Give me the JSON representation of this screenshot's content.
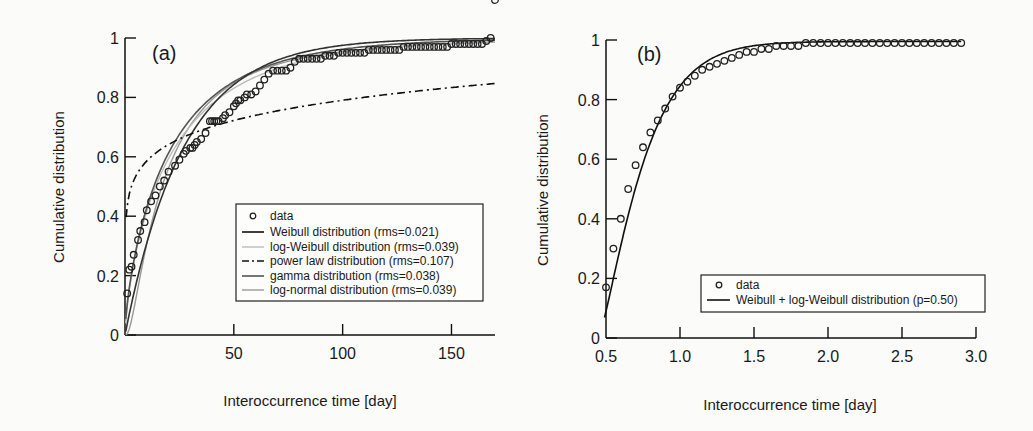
{
  "chart_data": [
    {
      "type": "line",
      "panel_label": "(a)",
      "title": "",
      "xlabel": "Interoccurrence time [day]",
      "ylabel": "Cumulative distribution",
      "xlim": [
        0,
        170
      ],
      "ylim": [
        0,
        1
      ],
      "xticks": [
        "50",
        "100",
        "150"
      ],
      "yticks": [
        "0",
        "0.2",
        "0.4",
        "0.6",
        "0.8",
        "1"
      ],
      "grid": false,
      "legend_position": "lower right",
      "series": [
        {
          "name": "data",
          "style": "open-circle",
          "x": [
            1,
            2,
            3,
            4,
            6,
            7,
            9,
            10,
            12,
            14,
            16,
            18,
            20,
            23,
            25,
            27,
            28,
            30,
            31,
            32,
            33,
            35,
            37,
            39,
            40,
            41,
            42,
            43,
            45,
            46,
            48,
            50,
            51,
            52,
            53,
            55,
            56,
            58,
            60,
            62,
            64,
            66,
            68,
            70,
            72,
            74,
            76,
            78,
            80,
            82,
            84,
            86,
            88,
            90,
            92,
            94,
            96,
            98,
            100,
            102,
            104,
            106,
            108,
            110,
            112,
            114,
            116,
            118,
            120,
            122,
            124,
            126,
            128,
            130,
            132,
            134,
            136,
            138,
            140,
            142,
            144,
            146,
            148,
            150,
            152,
            154,
            156,
            158,
            160,
            162,
            164,
            166,
            168,
            170
          ],
          "y": [
            0.14,
            0.22,
            0.23,
            0.27,
            0.32,
            0.35,
            0.38,
            0.42,
            0.45,
            0.47,
            0.5,
            0.52,
            0.55,
            0.57,
            0.59,
            0.61,
            0.62,
            0.63,
            0.63,
            0.64,
            0.65,
            0.66,
            0.68,
            0.72,
            0.72,
            0.72,
            0.72,
            0.72,
            0.73,
            0.74,
            0.75,
            0.77,
            0.78,
            0.79,
            0.79,
            0.8,
            0.81,
            0.81,
            0.82,
            0.84,
            0.86,
            0.88,
            0.89,
            0.89,
            0.89,
            0.89,
            0.9,
            0.92,
            0.93,
            0.93,
            0.93,
            0.93,
            0.93,
            0.93,
            0.94,
            0.94,
            0.94,
            0.95,
            0.95,
            0.95,
            0.95,
            0.95,
            0.95,
            0.95,
            0.96,
            0.96,
            0.96,
            0.96,
            0.96,
            0.96,
            0.96,
            0.96,
            0.97,
            0.97,
            0.97,
            0.97,
            0.97,
            0.97,
            0.97,
            0.97,
            0.97,
            0.97,
            0.97,
            0.98,
            0.98,
            0.98,
            0.98,
            0.98,
            0.98,
            0.98,
            0.98,
            0.99,
            1.0
          ]
        },
        {
          "name": "Weibull distribution (rms=0.021)",
          "style": "solid-black",
          "rms": 0.021
        },
        {
          "name": "log-Weibull distribution (rms=0.039)",
          "style": "solid-lightgray",
          "rms": 0.039
        },
        {
          "name": "power law distribution (rms=0.107)",
          "style": "dash-dot-black",
          "rms": 0.107
        },
        {
          "name": "gamma distribution (rms=0.038)",
          "style": "solid-darkgray",
          "rms": 0.038
        },
        {
          "name": "log-normal distribution (rms=0.039)",
          "style": "solid-gray",
          "rms": 0.039
        }
      ],
      "legend": [
        "data",
        "Weibull distribution (rms=0.021)",
        "log-Weibull distribution (rms=0.039)",
        "power law distribution (rms=0.107)",
        "gamma distribution (rms=0.038)",
        "log-normal distribution (rms=0.039)"
      ]
    },
    {
      "type": "line",
      "panel_label": "(b)",
      "title": "",
      "xlabel": "Interoccurrence time [day]",
      "ylabel": "Cumulative distribution",
      "xlim": [
        0.5,
        3.0
      ],
      "ylim": [
        0,
        1
      ],
      "xticks": [
        "0.5",
        "1.0",
        "1.5",
        "2.0",
        "2.5",
        "3.0"
      ],
      "yticks": [
        "0",
        "0.2",
        "0.4",
        "0.6",
        "0.8",
        "1"
      ],
      "grid": false,
      "legend_position": "lower right",
      "series": [
        {
          "name": "data",
          "style": "open-circle",
          "x": [
            0.5,
            0.55,
            0.6,
            0.65,
            0.7,
            0.75,
            0.8,
            0.85,
            0.9,
            0.95,
            1.0,
            1.05,
            1.1,
            1.15,
            1.2,
            1.25,
            1.3,
            1.35,
            1.4,
            1.45,
            1.5,
            1.55,
            1.6,
            1.65,
            1.7,
            1.75,
            1.8,
            1.85,
            1.9,
            1.95,
            2.0,
            2.05,
            2.1,
            2.15,
            2.2,
            2.25,
            2.3,
            2.35,
            2.4,
            2.45,
            2.5,
            2.55,
            2.6,
            2.65,
            2.7,
            2.75,
            2.8,
            2.85,
            2.9
          ],
          "y": [
            0.17,
            0.3,
            0.4,
            0.5,
            0.58,
            0.64,
            0.69,
            0.73,
            0.77,
            0.81,
            0.84,
            0.86,
            0.88,
            0.9,
            0.91,
            0.92,
            0.93,
            0.94,
            0.95,
            0.96,
            0.96,
            0.97,
            0.97,
            0.98,
            0.98,
            0.98,
            0.98,
            0.99,
            0.99,
            0.99,
            0.99,
            0.99,
            0.99,
            0.99,
            0.99,
            0.99,
            0.99,
            0.99,
            0.99,
            0.99,
            0.99,
            0.99,
            0.99,
            0.99,
            0.99,
            0.99,
            0.99,
            0.99,
            0.99
          ]
        },
        {
          "name": "Weibull + log-Weibull distribution (p=0.50)",
          "style": "solid-black",
          "p": 0.5
        }
      ],
      "legend": [
        "data",
        "Weibull + log-Weibull distribution (p=0.50)"
      ]
    }
  ]
}
